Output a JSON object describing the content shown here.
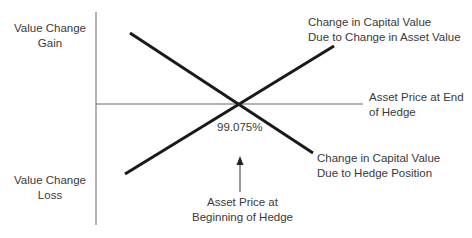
{
  "labels": {
    "y_top": [
      "Value Change",
      "Gain"
    ],
    "y_bottom": [
      "Value Change",
      "Loss"
    ],
    "line_asset": [
      "Change in Capital Value",
      "Due to Change in Asset Value"
    ],
    "x_axis": [
      "Asset Price at End",
      "of Hedge"
    ],
    "line_hedge": [
      "Change in Capital Value",
      "Due to Hedge Position"
    ],
    "intersection_value": "99.075%",
    "arrow_label": [
      "Asset Price at",
      "Beginning of Hedge"
    ]
  },
  "colors": {
    "line": "#1a1a1a",
    "axis": "#555555",
    "text": "#3a3a3a"
  }
}
